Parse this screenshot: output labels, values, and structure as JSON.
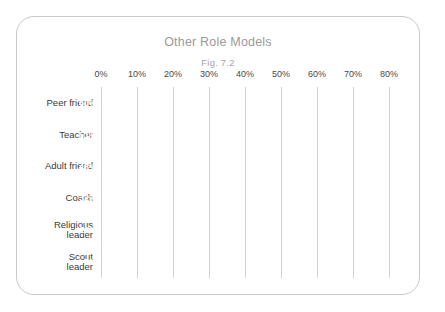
{
  "figure": {
    "title": "Other Role Models",
    "subtitle": "Fig. 7.2",
    "card_border_color": "#c9c9c9",
    "background_color": "#ffffff"
  },
  "chart_data": {
    "type": "bar",
    "orientation": "horizontal",
    "title": "Other Role Models",
    "subtitle": "Fig. 7.2",
    "xlabel": "",
    "ylabel": "",
    "xlim": [
      0,
      80
    ],
    "xtick_labels": [
      "0%",
      "10%",
      "20%",
      "30%",
      "40%",
      "50%",
      "60%",
      "70%",
      "80%"
    ],
    "xticks": [
      0,
      10,
      20,
      30,
      40,
      50,
      60,
      70,
      80
    ],
    "grid": "vertical",
    "legend": "none",
    "value_suffix": "%",
    "bar_color": "#9d9d9d",
    "value_label_color": "#ffffff",
    "categories": [
      "Peer friend",
      "Teacher",
      "Adult friend",
      "Coach",
      "Religious\nleader",
      "Scout\nleader"
    ],
    "values": [
      60,
      51,
      48,
      32,
      19,
      7
    ],
    "value_labels": [
      "60%",
      "51%",
      "48%",
      "32%",
      "19%",
      "7%"
    ]
  }
}
